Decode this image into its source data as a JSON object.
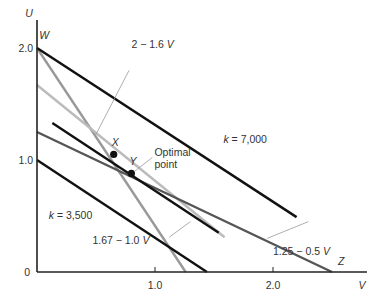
{
  "chart_data": {
    "type": "line",
    "title": "",
    "xlabel": "V",
    "ylabel": "U",
    "xlim": [
      0,
      2.8
    ],
    "ylim": [
      0,
      2.15
    ],
    "x_ticks": [
      {
        "value": 1.0,
        "label": "1.0"
      },
      {
        "value": 2.0,
        "label": "2.0"
      }
    ],
    "y_ticks": [
      {
        "value": 1.0,
        "label": "1.0"
      },
      {
        "value": 2.0,
        "label": "2.0"
      }
    ],
    "origin_label": "0",
    "grid": false,
    "series": [
      {
        "name": "k = 7,000",
        "kind": "isoprofit",
        "color": "#111111",
        "points": [
          [
            0,
            2.0
          ],
          [
            2.2,
            0.49
          ]
        ],
        "label": {
          "text": "k = 7,000",
          "at": [
            1.58,
            1.15
          ]
        }
      },
      {
        "name": "isoprofit through Y",
        "kind": "isoprofit",
        "color": "#111111",
        "points": [
          [
            0.13,
            1.33
          ],
          [
            1.54,
            0.35
          ]
        ]
      },
      {
        "name": "k = 3,500",
        "kind": "isoprofit",
        "color": "#111111",
        "points": [
          [
            0,
            1.0
          ],
          [
            1.44,
            0
          ]
        ],
        "label": {
          "text": "k = 3,500",
          "at": [
            0.1,
            0.47
          ]
        }
      },
      {
        "name": "2 - 1.6 V",
        "kind": "constraint",
        "color": "#999999",
        "points": [
          [
            0,
            2.0
          ],
          [
            1.26,
            0
          ]
        ],
        "label": {
          "text": "2 − 1.6 V",
          "at": [
            0.8,
            2.0
          ]
        },
        "leader": [
          [
            0.5,
            1.23
          ],
          [
            0.78,
            1.8
          ]
        ]
      },
      {
        "name": "1.67 - 1.0 V",
        "kind": "constraint",
        "color": "#bbbbbb",
        "points": [
          [
            0,
            1.67
          ],
          [
            1.59,
            0.31
          ]
        ],
        "label": {
          "text": "1.67 − 1.0 V",
          "at": [
            0.47,
            0.25
          ]
        },
        "leader": [
          [
            1.12,
            0.31
          ],
          [
            1.3,
            0.45
          ]
        ]
      },
      {
        "name": "1.25 - 0.5 V",
        "kind": "constraint",
        "color": "#555555",
        "points": [
          [
            0,
            1.25
          ],
          [
            2.5,
            0
          ]
        ],
        "label": {
          "text": "1.25 − 0.5 V",
          "at": [
            2.0,
            0.15
          ]
        },
        "leader": [
          [
            1.95,
            0.3
          ],
          [
            2.3,
            0.45
          ]
        ]
      }
    ],
    "points": [
      {
        "name": "X",
        "x": 0.65,
        "y": 1.05
      },
      {
        "name": "Y",
        "x": 0.8,
        "y": 0.88,
        "annotation": "Optimal point"
      }
    ],
    "vertex_labels": [
      {
        "text": "W",
        "x": 0.02,
        "y": 2.08
      },
      {
        "text": "Z",
        "x": 2.55,
        "y": 0.06
      }
    ]
  }
}
